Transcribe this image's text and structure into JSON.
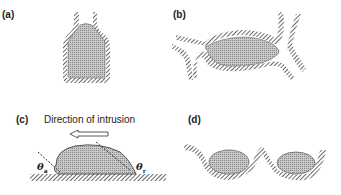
{
  "panels": {
    "a": {
      "label": "(a)"
    },
    "b": {
      "label": "(b)"
    },
    "c": {
      "label": "(c)",
      "caption": "Direction of intrusion",
      "arrow_direction": "left",
      "theta_advancing": {
        "symbol": "θ",
        "sub": "a"
      },
      "theta_receding": {
        "symbol": "θ",
        "sub": "r"
      }
    },
    "d": {
      "label": "(d)"
    }
  },
  "colors": {
    "wall_hatch": "#4a4a4a",
    "fluid_fill": "#b8b8b8",
    "outline": "#333333"
  }
}
